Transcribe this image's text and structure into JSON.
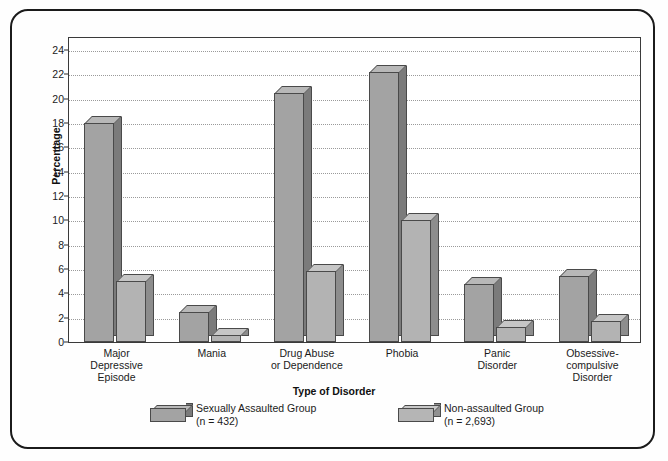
{
  "chart_data": {
    "type": "bar",
    "title": "",
    "xlabel": "Type of Disorder",
    "ylabel": "Percentage",
    "ylim": [
      0,
      25
    ],
    "yticks": [
      0,
      2,
      4,
      6,
      8,
      10,
      12,
      14,
      16,
      18,
      20,
      22,
      24
    ],
    "grid": true,
    "legend_position": "bottom",
    "categories": [
      "Major\nDepressive\nEpisode",
      "Mania",
      "Drug Abuse\nor Dependence",
      "Phobia",
      "Panic\nDisorder",
      "Obsessive-\ncompulsive\nDisorder"
    ],
    "category_lines": [
      [
        "Major",
        "Depressive",
        "Episode"
      ],
      [
        "Mania"
      ],
      [
        "Drug Abuse",
        "or Dependence"
      ],
      [
        "Phobia"
      ],
      [
        "Panic",
        "Disorder"
      ],
      [
        "Obsessive-",
        "compulsive",
        "Disorder"
      ]
    ],
    "series": [
      {
        "name": "Sexually Assaulted Group",
        "sublabel": "(n = 432)",
        "color": "#a3a3a3",
        "values": [
          18.0,
          2.5,
          20.5,
          22.2,
          4.8,
          5.4
        ]
      },
      {
        "name": "Non-assaulted Group",
        "sublabel": "(n = 2,693)",
        "color": "#b5b5b5",
        "values": [
          5.0,
          0.6,
          5.8,
          10.0,
          1.2,
          1.7
        ]
      }
    ]
  },
  "axes": {
    "y_title": "Percentage",
    "x_title": "Type of Disorder",
    "y_tick_labels": [
      "0",
      "2",
      "4",
      "6",
      "8",
      "10",
      "12",
      "14",
      "16",
      "18",
      "20",
      "22",
      "24"
    ]
  },
  "legend": {
    "entries": [
      {
        "label": "Sexually Assaulted Group",
        "sublabel": "(n = 432)",
        "swatch": "dark-gray-3d-box"
      },
      {
        "label": "Non-assaulted Group",
        "sublabel": "(n = 2,693)",
        "swatch": "light-gray-3d-box"
      }
    ]
  }
}
